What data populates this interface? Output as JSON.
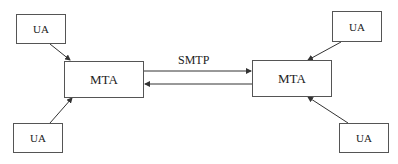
{
  "diagram": {
    "nodes": [
      {
        "id": "ua_top_left",
        "label": "UA",
        "type": "user-agent"
      },
      {
        "id": "mta_left",
        "label": "MTA",
        "type": "mail-transfer-agent"
      },
      {
        "id": "ua_bottom_left",
        "label": "UA",
        "type": "user-agent"
      },
      {
        "id": "mta_right",
        "label": "MTA",
        "type": "mail-transfer-agent"
      },
      {
        "id": "ua_top_right",
        "label": "UA",
        "type": "user-agent"
      },
      {
        "id": "ua_bottom_right",
        "label": "UA",
        "type": "user-agent"
      }
    ],
    "edges": [
      {
        "from": "ua_top_left",
        "to": "mta_left"
      },
      {
        "from": "ua_bottom_left",
        "to": "mta_left"
      },
      {
        "from": "mta_left",
        "to": "mta_right",
        "label": "SMTP"
      },
      {
        "from": "mta_right",
        "to": "mta_left"
      },
      {
        "from": "ua_top_right",
        "to": "mta_right"
      },
      {
        "from": "ua_bottom_right",
        "to": "mta_right"
      }
    ],
    "smtp_label": "SMTP"
  }
}
